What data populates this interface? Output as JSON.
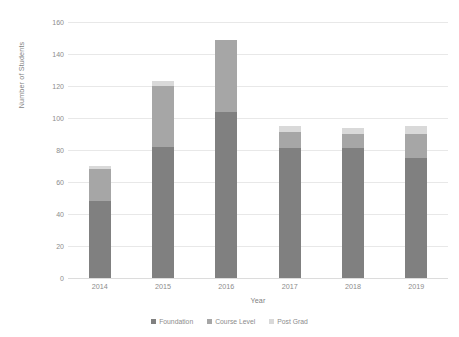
{
  "chart_data": {
    "type": "bar",
    "subtype": "stacked-bar",
    "title": "",
    "xlabel": "Year",
    "ylabel": "Number of Students",
    "categories": [
      "2014",
      "2015",
      "2016",
      "2017",
      "2018",
      "2019"
    ],
    "series": [
      {
        "name": "Foundation",
        "color": "#808080",
        "values": [
          48,
          82,
          104,
          81,
          81,
          75
        ]
      },
      {
        "name": "Course Level",
        "color": "#a6a6a6",
        "values": [
          20,
          38,
          45,
          10,
          9,
          15
        ]
      },
      {
        "name": "Post Grad",
        "color": "#d9d9d9",
        "values": [
          2,
          3,
          0,
          4,
          4,
          5
        ]
      }
    ],
    "totals": [
      70,
      123,
      149,
      95,
      94,
      95
    ],
    "ylim": [
      0,
      160
    ],
    "ytick_labels": [
      "0",
      "20",
      "40",
      "60",
      "80",
      "100",
      "120",
      "140",
      "160"
    ],
    "ytick_values": [
      0,
      20,
      40,
      60,
      80,
      100,
      120,
      140,
      160
    ],
    "grid": true,
    "grid_axis": "y",
    "legend_position": "bottom",
    "legend_entries": [
      "Foundation",
      "Course Level",
      "Post Grad"
    ],
    "background": "#ffffff",
    "text_color": "#8c8c8c"
  }
}
